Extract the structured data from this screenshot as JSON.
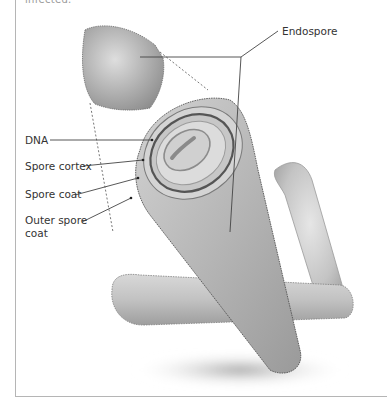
{
  "figure": {
    "caption_fragment": "infected.",
    "labels": {
      "endospore": "Endospore",
      "dna": "DNA",
      "spore_cortex": "Spore cortex",
      "spore_coat": "Spore coat",
      "outer_spore_coat_line1": "Outer spore",
      "outer_spore_coat_line2": "coat"
    }
  },
  "colors": {
    "frame": "#b5b5b5",
    "leader_line": "#444444",
    "label_text": "#333333",
    "spore_body": "#c9c9c9",
    "spore_dark": "#8a8a8a"
  }
}
